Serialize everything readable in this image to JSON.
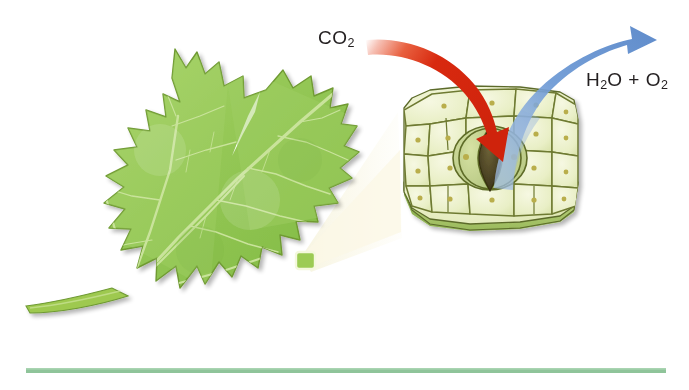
{
  "figure": {
    "background_color": "#ffffff",
    "width": 689,
    "height": 390
  },
  "labels": {
    "co2": {
      "formula": "CO",
      "subscript": "2",
      "full_text": "CO2",
      "color": "#231f20"
    },
    "h2o_o2": {
      "formula_a": "H",
      "sub_a": "2",
      "mid": "O + O",
      "sub_b": "2",
      "full_text": "H2O + O2",
      "color": "#231f20"
    }
  },
  "arrows": {
    "intake": {
      "name": "co2-intake-arrow",
      "color": "#d8290f",
      "color_fade": "#f4b9ad",
      "direction": "down-right-into-stoma"
    },
    "output": {
      "name": "h2o-o2-output-arrow",
      "color": "#5d8fd1",
      "color_fade": "#a9c4e6",
      "direction": "up-right-out-of-stoma"
    }
  },
  "leaf": {
    "name": "grape-leaf",
    "fill_light": "#a6d166",
    "fill_mid": "#8fc34e",
    "fill_dark": "#79b23f",
    "outline": "#6f9a33",
    "vein_color": "#c9e29a",
    "stem_color": "#9ec94f",
    "callout_square": {
      "name": "leaf-magnification-marker",
      "stroke": "#f2f7d8",
      "fill": "#9ccb54"
    }
  },
  "magnifier_cone": {
    "name": "magnification-cone",
    "fill": "#faf8e8"
  },
  "epidermis": {
    "name": "leaf-epidermis-cells",
    "cell_fill_light": "#f1f4d2",
    "cell_fill": "#e6edc2",
    "cell_outline": "#6e7a31",
    "cell_dot": "#b9ae4c",
    "block_side_fill": "#b9cf78",
    "block_edge": "#5c6b2a",
    "stoma": {
      "name": "stoma",
      "guard_cell_fill": "#c6d38e",
      "guard_cell_outline": "#5e6c28",
      "pore_fill": "#4d4526",
      "pore_outline": "#3a3318"
    }
  },
  "baseline_rule": {
    "name": "bottom-rule",
    "color": "#8fc49a"
  }
}
